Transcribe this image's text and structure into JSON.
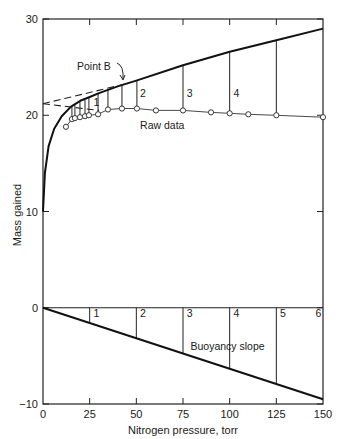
{
  "chart_data": {
    "type": "line",
    "title": "",
    "xlabel": "Nitrogen pressure, torr",
    "ylabel": "Mass gained",
    "xlim": [
      0,
      150
    ],
    "ylim": [
      -10,
      30
    ],
    "x_ticks": [
      0,
      25,
      50,
      75,
      100,
      125,
      150
    ],
    "y_ticks": [
      -10,
      0,
      10,
      20,
      30
    ],
    "grid": false,
    "legend": null,
    "series": [
      {
        "name": "Raw data",
        "style": "markers-with-thin-line",
        "x": [
          12.3,
          15.5,
          17.1,
          19.8,
          22.5,
          24.6,
          29.5,
          34.8,
          42.3,
          50.3,
          60.5,
          75,
          90,
          100,
          110,
          125,
          150
        ],
        "y": [
          18.8,
          19.6,
          19.7,
          19.8,
          19.9,
          20.0,
          20.1,
          20.6,
          20.7,
          20.7,
          20.5,
          20.5,
          20.3,
          20.2,
          20.1,
          20.0,
          19.8
        ]
      },
      {
        "name": "Corrected curve (raw data minus buoyancy)",
        "style": "thick-line",
        "x": [
          0,
          1,
          3,
          6,
          10,
          15,
          20,
          25,
          30,
          40,
          50,
          75,
          100,
          125,
          150
        ],
        "y": [
          10.0,
          14.0,
          16.8,
          18.6,
          19.9,
          20.9,
          21.5,
          21.9,
          22.3,
          23.0,
          23.6,
          25.2,
          26.6,
          27.8,
          29.0
        ]
      },
      {
        "name": "Upper extrapolation (dashed)",
        "style": "dashed",
        "x": [
          0,
          45
        ],
        "y": [
          21.2,
          23.3
        ]
      },
      {
        "name": "Lower extrapolation (dashed)",
        "style": "dashed",
        "x": [
          0,
          30
        ],
        "y": [
          21.2,
          20.5
        ]
      },
      {
        "name": "Buoyancy slope",
        "style": "thick-line",
        "x": [
          0,
          150
        ],
        "y": [
          0,
          -9.5
        ]
      }
    ],
    "correction_segments_upper": [
      {
        "x": 15.5,
        "from": 19.6,
        "to": 20.9
      },
      {
        "x": 17.1,
        "from": 19.7,
        "to": 21.1
      },
      {
        "x": 19.8,
        "from": 19.8,
        "to": 21.4
      },
      {
        "x": 22.5,
        "from": 19.9,
        "to": 21.6
      },
      {
        "x": 24.6,
        "from": 20.0,
        "to": 21.8
      },
      {
        "x": 29.5,
        "from": 20.1,
        "to": 22.3
      },
      {
        "x": 34.8,
        "from": 20.6,
        "to": 22.7
      },
      {
        "x": 42.3,
        "from": 20.7,
        "to": 23.2
      },
      {
        "x": 50.3,
        "from": 20.7,
        "to": 23.6
      },
      {
        "x": 75,
        "from": 20.5,
        "to": 25.2
      },
      {
        "x": 100,
        "from": 20.2,
        "to": 26.6
      },
      {
        "x": 125,
        "from": 20.0,
        "to": 27.8
      }
    ],
    "correction_segments_lower": [
      {
        "x": 25,
        "from": 0,
        "to": -1.6
      },
      {
        "x": 50,
        "from": 0,
        "to": -3.2
      },
      {
        "x": 75,
        "from": 0,
        "to": -4.8
      },
      {
        "x": 100,
        "from": 0,
        "to": -6.3
      },
      {
        "x": 125,
        "from": 0,
        "to": -7.9
      }
    ],
    "annotations": [
      {
        "text": "Point B",
        "x": 43,
        "y": 23.3,
        "arrow": true
      },
      {
        "text": "Raw data",
        "x": 52,
        "y": 18.6
      },
      {
        "text": "Buoyancy slope",
        "x": 79,
        "y": -4.4
      },
      {
        "text": "1",
        "x": 27,
        "y": 21.0
      },
      {
        "text": "2",
        "x": 52,
        "y": 21.9
      },
      {
        "text": "3",
        "x": 77,
        "y": 21.9
      },
      {
        "text": "4",
        "x": 102,
        "y": 21.9
      },
      {
        "text": "1",
        "x": 27,
        "y": -1.0
      },
      {
        "text": "2",
        "x": 52,
        "y": -1.0
      },
      {
        "text": "3",
        "x": 77,
        "y": -1.0
      },
      {
        "text": "4",
        "x": 102,
        "y": -1.0
      },
      {
        "text": "5",
        "x": 127,
        "y": -1.0
      },
      {
        "text": "6",
        "x": 146,
        "y": -1.0
      }
    ]
  },
  "labels": {
    "xlabel": "Nitrogen pressure, torr",
    "ylabel": "Mass gained",
    "point_b": "Point B",
    "raw_data": "Raw data",
    "buoyancy_slope": "Buoyancy slope"
  }
}
